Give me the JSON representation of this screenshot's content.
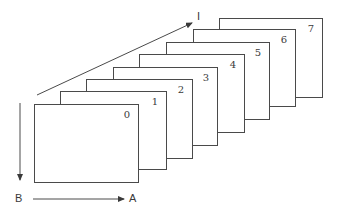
{
  "diagram": {
    "type": "stacked-frames",
    "frames": [
      {
        "label": "0",
        "x": 34,
        "y": 104,
        "w": 105,
        "h": 79
      },
      {
        "label": "1",
        "x": 60,
        "y": 91,
        "w": 107,
        "h": 79
      },
      {
        "label": "2",
        "x": 86,
        "y": 79,
        "w": 107,
        "h": 80
      },
      {
        "label": "3",
        "x": 113,
        "y": 67,
        "w": 105,
        "h": 79
      },
      {
        "label": "4",
        "x": 139,
        "y": 54,
        "w": 106,
        "h": 79
      },
      {
        "label": "5",
        "x": 166,
        "y": 42,
        "w": 104,
        "h": 78
      },
      {
        "label": "6",
        "x": 193,
        "y": 29,
        "w": 103,
        "h": 78
      },
      {
        "label": "7",
        "x": 219,
        "y": 18,
        "w": 104,
        "h": 80
      }
    ],
    "axes": {
      "depth": {
        "label": "I"
      },
      "vertical": {
        "label": "B"
      },
      "horizontal": {
        "label": "A"
      }
    },
    "line_color": "#4a4a4a"
  }
}
